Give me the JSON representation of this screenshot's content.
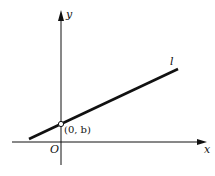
{
  "diagram": {
    "labels": {
      "x_axis": "x",
      "y_axis": "y",
      "origin": "O",
      "line": "l",
      "intercept_point": "(0, b)"
    },
    "colors": {
      "stroke": "#111111",
      "background": "#ffffff"
    }
  }
}
